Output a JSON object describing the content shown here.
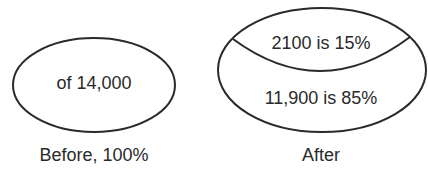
{
  "diagram": {
    "before": {
      "inner_text": "of 14,000",
      "caption": "Before, 100%"
    },
    "after": {
      "top_segment_text": "2100 is 15%",
      "bottom_segment_text": "11,900 is 85%",
      "caption": "After"
    }
  },
  "colors": {
    "stroke": "#2a2a2a",
    "background": "#ffffff"
  }
}
